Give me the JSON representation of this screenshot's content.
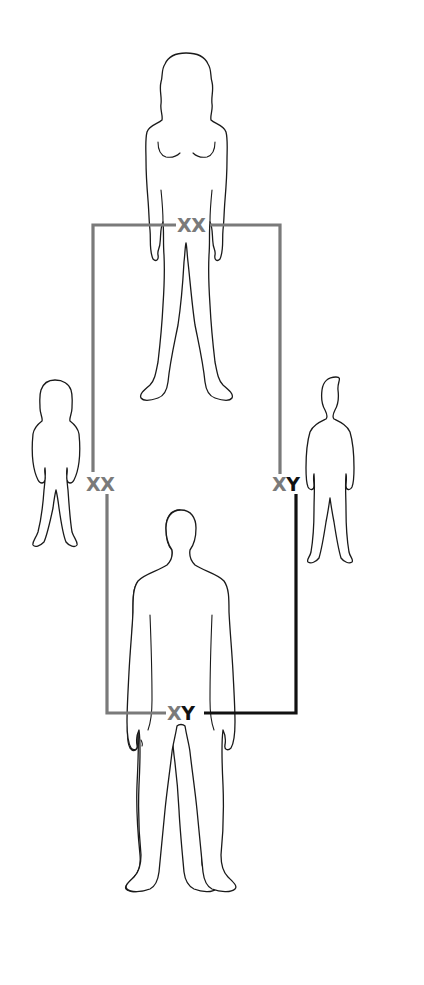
{
  "diagram": {
    "type": "sex-chromosome-inheritance",
    "colors": {
      "x_chromosome": "#7a7a7a",
      "y_chromosome": "#111111",
      "outline": "#1a1a1a",
      "background": "#ffffff"
    },
    "figures": {
      "mother": {
        "role": "adult-female",
        "label_x1": "X",
        "label_x2": "X"
      },
      "father": {
        "role": "adult-male",
        "label_x": "X",
        "label_y": "Y"
      },
      "daughter": {
        "role": "girl-child",
        "label_x1": "X",
        "label_x2": "X"
      },
      "son": {
        "role": "boy-child",
        "label_x": "X",
        "label_y": "Y"
      }
    }
  }
}
